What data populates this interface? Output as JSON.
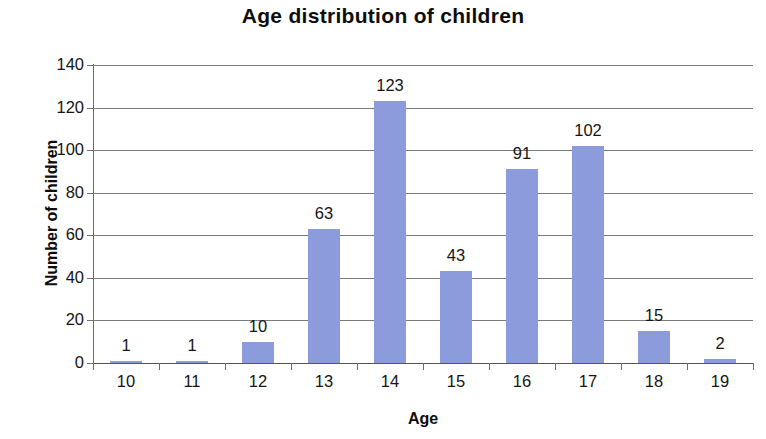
{
  "chart_data": {
    "type": "bar",
    "title": "Age distribution of children",
    "xlabel": "Age",
    "ylabel": "Number of children",
    "categories": [
      "10",
      "11",
      "12",
      "13",
      "14",
      "15",
      "16",
      "17",
      "18",
      "19"
    ],
    "values": [
      1,
      1,
      10,
      63,
      123,
      43,
      91,
      102,
      15,
      2
    ],
    "value_labels": [
      "1",
      "1",
      "10",
      "63",
      "123",
      "43",
      "91",
      "102",
      "15",
      "2"
    ],
    "ylim": [
      0,
      140
    ],
    "ytick_labels": [
      "140",
      "120",
      "100",
      "80",
      "60",
      "40",
      "20",
      "0"
    ],
    "ytick_values": [
      140,
      120,
      100,
      80,
      60,
      40,
      20,
      0
    ],
    "ytick_step": 20,
    "grid": true,
    "legend": false,
    "bar_color": "#8b9bdc",
    "gridline_color": "#7a7a7a",
    "axis_color": "#6e6e6e",
    "background_color": "#ffffff",
    "text_color": "#151515"
  }
}
